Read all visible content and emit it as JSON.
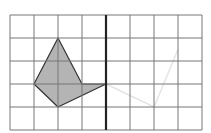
{
  "grid": {
    "columns": 8,
    "rows": 5,
    "origin_x": 10,
    "origin_y": 15,
    "cell_w": 24,
    "cell_h": 23,
    "line_color": "#777777",
    "mirror_line_column": 4,
    "mirror_line_color": "#222222"
  },
  "shape": {
    "fill": "#b4b4b4",
    "stroke": "#333333",
    "vertices_grid": [
      [
        2,
        1
      ],
      [
        3,
        3
      ],
      [
        4,
        3
      ],
      [
        2,
        4
      ],
      [
        1,
        3
      ]
    ]
  },
  "ghost_trace": {
    "color": "#e4e4e4",
    "points_grid": [
      [
        4,
        3
      ],
      [
        6,
        4
      ],
      [
        7,
        1.5
      ]
    ]
  }
}
